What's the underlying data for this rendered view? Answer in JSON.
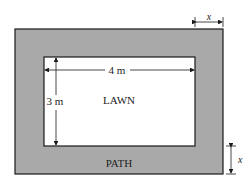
{
  "diagram": {
    "lawn_label": "LAWN",
    "path_label": "PATH",
    "width_label": "4 m",
    "height_label": "3 m",
    "path_width_top_label": "x",
    "path_width_side_label": "x",
    "colors": {
      "path": "#a9a9a9",
      "lawn": "#ffffff",
      "stroke": "#1a1a1a"
    }
  }
}
